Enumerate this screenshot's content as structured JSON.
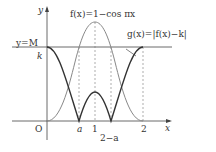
{
  "figure": {
    "f_label": "f(x)=1−cos πx",
    "g_label": "g(x)=|f(x)−k|",
    "line_label": "y=M",
    "y_axis_label": "y",
    "x_axis_label": "x",
    "origin_label": "O",
    "k_label": "k",
    "tick_labels": {
      "a": "a",
      "one": "1",
      "two_minus_a": "2−a",
      "two": "2"
    },
    "colors": {
      "f_curve": "#888888",
      "g_curve": "#333333",
      "axes": "#444444",
      "dashed": "#777777"
    }
  }
}
